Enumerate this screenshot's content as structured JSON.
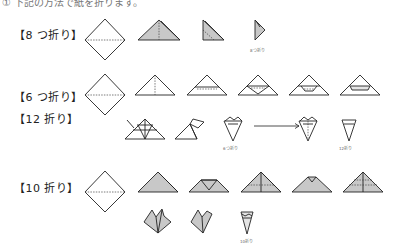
{
  "header": {
    "text": "① 下記の方法で紙を折ります。"
  },
  "rows": {
    "eight": {
      "label": "【8 つ折り】",
      "caption": "8つ折り"
    },
    "six": {
      "label": "【6 つ折り】"
    },
    "twelve": {
      "label": "【12 折り】",
      "caption_mid": "6つ折り",
      "caption_end": "12折り"
    },
    "ten": {
      "label": "【10 折り】",
      "caption": "10折り"
    }
  },
  "colors": {
    "paper_fill": "#c8c8c8",
    "paper_light": "#e4e4e4",
    "line": "#222222",
    "background": "#ffffff"
  }
}
